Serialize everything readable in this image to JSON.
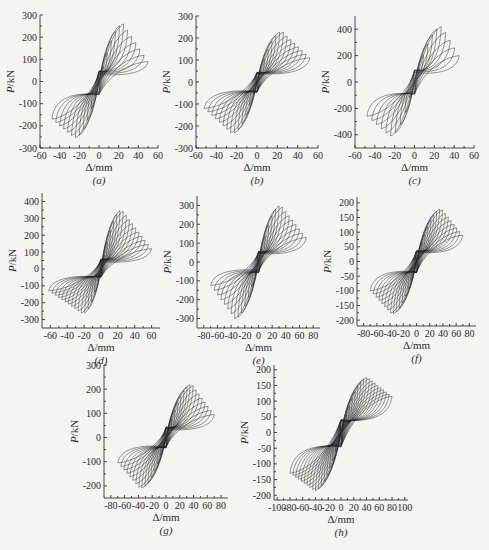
{
  "chart_data": [
    {
      "id": "a",
      "caption": "(a)",
      "type": "line",
      "xlabel": "Δ/mm",
      "ylabel": "P/kN",
      "xlim": [
        -60,
        60
      ],
      "ylim": [
        -300,
        300
      ],
      "xticks": [
        -60,
        -40,
        -20,
        0,
        20,
        40,
        60
      ],
      "yticks": [
        -300,
        -200,
        -100,
        0,
        100,
        200,
        300
      ],
      "peak_positive": {
        "x": 25,
        "y": 260
      },
      "peak_negative": {
        "x": -25,
        "y": -255
      },
      "final_cycle": {
        "x_pos": 50,
        "y_pos": 90,
        "x_neg": -48,
        "y_neg": -170
      },
      "cycles": 12,
      "box": {
        "left": 40,
        "top": 15,
        "right": 158,
        "bottom": 148
      }
    },
    {
      "id": "b",
      "caption": "(b)",
      "type": "line",
      "xlabel": "Δ/mm",
      "ylabel": "P/kN",
      "xlim": [
        -60,
        60
      ],
      "ylim": [
        -300,
        300
      ],
      "xticks": [
        -60,
        -40,
        -20,
        0,
        20,
        40,
        60
      ],
      "yticks": [
        -300,
        -200,
        -100,
        0,
        100,
        200,
        300
      ],
      "peak_positive": {
        "x": 25,
        "y": 230
      },
      "peak_negative": {
        "x": -25,
        "y": -235
      },
      "final_cycle": {
        "x_pos": 52,
        "y_pos": 110,
        "x_neg": -52,
        "y_neg": -120
      },
      "cycles": 14,
      "box": {
        "left": 196,
        "top": 16,
        "right": 318,
        "bottom": 148
      }
    },
    {
      "id": "c",
      "caption": "(c)",
      "type": "line",
      "xlabel": "Δ/mm",
      "ylabel": "P/kN",
      "xlim": [
        -60,
        60
      ],
      "ylim": [
        -500,
        500
      ],
      "xticks": [
        -60,
        -40,
        -20,
        0,
        20,
        40,
        60
      ],
      "yticks": [
        -400,
        -200,
        0,
        200,
        400
      ],
      "peak_positive": {
        "x": 28,
        "y": 420
      },
      "peak_negative": {
        "x": -25,
        "y": -410
      },
      "final_cycle": {
        "x_pos": 45,
        "y_pos": 200,
        "x_neg": -48,
        "y_neg": -260
      },
      "cycles": 10,
      "box": {
        "left": 355,
        "top": 16,
        "right": 474,
        "bottom": 148
      }
    },
    {
      "id": "d",
      "caption": "(d)",
      "type": "line",
      "xlabel": "Δ/mm",
      "ylabel": "P/kN",
      "xlim": [
        -70,
        70
      ],
      "ylim": [
        -350,
        450
      ],
      "xticks": [
        -60,
        -40,
        -20,
        0,
        20,
        40,
        60
      ],
      "yticks": [
        -300,
        -200,
        -100,
        0,
        100,
        200,
        300,
        400
      ],
      "peak_positive": {
        "x": 25,
        "y": 350
      },
      "peak_negative": {
        "x": -22,
        "y": -265
      },
      "final_cycle": {
        "x_pos": 60,
        "y_pos": 120,
        "x_neg": -62,
        "y_neg": -130
      },
      "cycles": 16,
      "box": {
        "left": 42,
        "top": 193,
        "right": 160,
        "bottom": 328
      }
    },
    {
      "id": "e",
      "caption": "(e)",
      "type": "line",
      "xlabel": "Δ/mm",
      "ylabel": "P/kN",
      "xlim": [
        -90,
        90
      ],
      "ylim": [
        -350,
        350
      ],
      "xticks": [
        -80,
        -60,
        -40,
        -20,
        0,
        20,
        40,
        60,
        80
      ],
      "yticks": [
        -300,
        -200,
        -100,
        0,
        100,
        200,
        300
      ],
      "peak_positive": {
        "x": 33,
        "y": 300
      },
      "peak_negative": {
        "x": -35,
        "y": -300
      },
      "final_cycle": {
        "x_pos": 70,
        "y_pos": 130,
        "x_neg": -70,
        "y_neg": -125
      },
      "cycles": 14,
      "box": {
        "left": 197,
        "top": 196,
        "right": 320,
        "bottom": 328
      }
    },
    {
      "id": "f",
      "caption": "(f)",
      "type": "line",
      "xlabel": "Δ/mm",
      "ylabel": "P/kN",
      "xlim": [
        -90,
        90
      ],
      "ylim": [
        -220,
        220
      ],
      "xticks": [
        -80,
        -60,
        -40,
        -20,
        0,
        20,
        40,
        60,
        80
      ],
      "yticks": [
        -200,
        -150,
        -100,
        -50,
        0,
        50,
        100,
        150,
        200
      ],
      "peak_positive": {
        "x": 38,
        "y": 180
      },
      "peak_negative": {
        "x": -38,
        "y": -180
      },
      "final_cycle": {
        "x_pos": 70,
        "y_pos": 90,
        "x_neg": -70,
        "y_neg": -100
      },
      "cycles": 16,
      "box": {
        "left": 357,
        "top": 197,
        "right": 476,
        "bottom": 326
      }
    },
    {
      "id": "g",
      "caption": "(g)",
      "type": "line",
      "xlabel": "Δ/mm",
      "ylabel": "P/kN",
      "xlim": [
        -90,
        90
      ],
      "ylim": [
        -250,
        300
      ],
      "xticks": [
        -80,
        -60,
        -40,
        -20,
        0,
        20,
        40,
        60,
        80
      ],
      "yticks": [
        -200,
        -100,
        0,
        100,
        200,
        300
      ],
      "peak_positive": {
        "x": 38,
        "y": 220
      },
      "peak_negative": {
        "x": -38,
        "y": -210
      },
      "final_cycle": {
        "x_pos": 70,
        "y_pos": 95,
        "x_neg": -70,
        "y_neg": -105
      },
      "cycles": 16,
      "box": {
        "left": 104,
        "top": 365,
        "right": 228,
        "bottom": 498
      }
    },
    {
      "id": "h",
      "caption": "(h)",
      "type": "line",
      "xlabel": "Δ/mm",
      "ylabel": "P/kN",
      "xlim": [
        -105,
        105
      ],
      "ylim": [
        -215,
        215
      ],
      "xticks": [
        -100,
        -80,
        -60,
        -40,
        -20,
        0,
        20,
        40,
        60,
        80,
        100
      ],
      "yticks": [
        -200,
        -150,
        -100,
        -50,
        0,
        50,
        100,
        150,
        200
      ],
      "peak_positive": {
        "x": 42,
        "y": 175
      },
      "peak_negative": {
        "x": -42,
        "y": -185
      },
      "final_cycle": {
        "x_pos": 80,
        "y_pos": 115,
        "x_neg": -80,
        "y_neg": -130
      },
      "cycles": 18,
      "box": {
        "left": 274,
        "top": 365,
        "right": 408,
        "bottom": 500
      }
    }
  ]
}
